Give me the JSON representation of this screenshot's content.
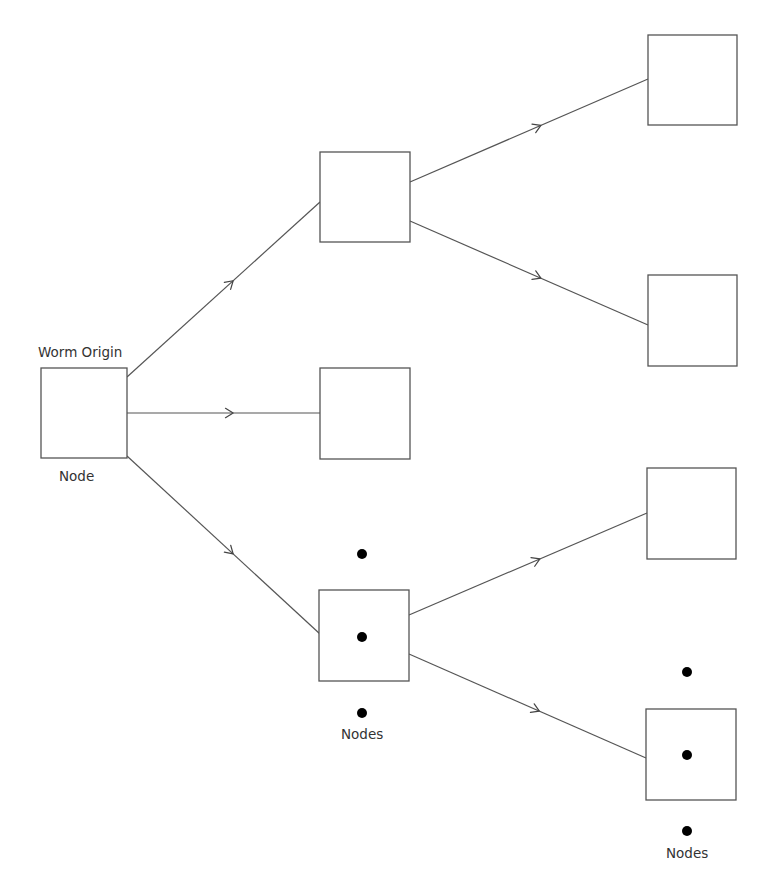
{
  "diagram": {
    "type": "tree / propagation graph",
    "colors": {
      "stroke": "#555555",
      "dot": "#000000",
      "text": "#333333",
      "background": "#ffffff"
    },
    "labels": {
      "origin_top": "Worm Origin",
      "origin_bottom": "Node",
      "nodes_mid": "Nodes",
      "nodes_right": "Nodes"
    },
    "nodes": [
      {
        "id": "origin",
        "x": 41,
        "y": 368,
        "w": 86,
        "h": 90,
        "label_above": "Worm Origin",
        "label_below": "Node"
      },
      {
        "id": "n1",
        "x": 320,
        "y": 152,
        "w": 90,
        "h": 90
      },
      {
        "id": "n2",
        "x": 320,
        "y": 368,
        "w": 90,
        "h": 91
      },
      {
        "id": "n3",
        "x": 319,
        "y": 590,
        "w": 90,
        "h": 91,
        "ellipsis": true,
        "label_below": "Nodes"
      },
      {
        "id": "n4",
        "x": 648,
        "y": 35,
        "w": 89,
        "h": 90
      },
      {
        "id": "n5",
        "x": 648,
        "y": 275,
        "w": 89,
        "h": 91
      },
      {
        "id": "n6",
        "x": 647,
        "y": 468,
        "w": 89,
        "h": 91
      },
      {
        "id": "n7",
        "x": 646,
        "y": 709,
        "w": 90,
        "h": 91,
        "ellipsis": true,
        "label_below": "Nodes"
      }
    ],
    "edges": [
      {
        "from": "origin",
        "to": "n1",
        "x1": 127,
        "y1": 377,
        "x2": 320,
        "y2": 202
      },
      {
        "from": "origin",
        "to": "n2",
        "x1": 127,
        "y1": 413,
        "x2": 320,
        "y2": 413
      },
      {
        "from": "origin",
        "to": "n3",
        "x1": 127,
        "y1": 456,
        "x2": 320,
        "y2": 634
      },
      {
        "from": "n1",
        "to": "n4",
        "x1": 410,
        "y1": 182,
        "x2": 648,
        "y2": 79
      },
      {
        "from": "n1",
        "to": "n5",
        "x1": 410,
        "y1": 221,
        "x2": 648,
        "y2": 325
      },
      {
        "from": "n3",
        "to": "n6",
        "x1": 409,
        "y1": 615,
        "x2": 647,
        "y2": 513
      },
      {
        "from": "n3",
        "to": "n7",
        "x1": 409,
        "y1": 654,
        "x2": 646,
        "y2": 758
      }
    ],
    "dots": [
      {
        "cx": 362,
        "cy": 554
      },
      {
        "cx": 362,
        "cy": 637
      },
      {
        "cx": 362,
        "cy": 713
      },
      {
        "cx": 687,
        "cy": 672
      },
      {
        "cx": 687,
        "cy": 755
      },
      {
        "cx": 687,
        "cy": 831
      }
    ]
  }
}
